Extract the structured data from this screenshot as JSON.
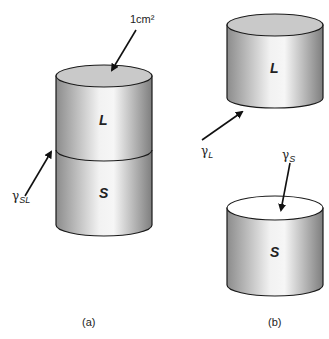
{
  "figure": {
    "panel_a": {
      "caption": "(a)",
      "area_label": "1cm²",
      "upper_phase": "L",
      "lower_phase": "S",
      "interface_symbol": "γ",
      "interface_subscript": "SL"
    },
    "panel_b": {
      "caption": "(b)",
      "upper_phase": "L",
      "lower_phase": "S",
      "liquid_symbol": "γ",
      "liquid_subscript": "L",
      "solid_symbol": "γ",
      "solid_subscript": "S"
    }
  },
  "colors": {
    "outline": "#1a1a1a",
    "top_face_liquid": "#c8c8c8",
    "top_face_solid": "#ffffff",
    "body_dark": "#8a8a8a",
    "body_light": "#f4f4f4"
  }
}
